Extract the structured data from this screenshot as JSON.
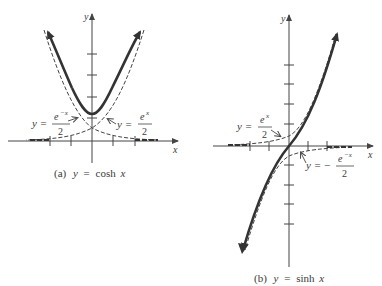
{
  "figure": {
    "panels": [
      {
        "id": "a",
        "caption_label": "(a)",
        "caption_eq_lhs": "y",
        "caption_eq_sign": "=",
        "caption_eq_rhs": "cosh",
        "caption_eq_var": "x",
        "x_axis_label": "x",
        "y_axis_label": "y",
        "annotations": [
          {
            "lhs": "y =",
            "numerator": "e",
            "exponent": "−x",
            "denominator": "2"
          },
          {
            "lhs": "y =",
            "numerator": "e",
            "exponent": "x",
            "denominator": "2"
          }
        ]
      },
      {
        "id": "b",
        "caption_label": "(b)",
        "caption_eq_lhs": "y",
        "caption_eq_sign": "=",
        "caption_eq_rhs": "sinh",
        "caption_eq_var": "x",
        "x_axis_label": "x",
        "y_axis_label": "y",
        "annotations": [
          {
            "lhs": "y =",
            "numerator": "e",
            "exponent": "x",
            "denominator": "2"
          },
          {
            "lhs": "y =  −",
            "numerator": "e",
            "exponent": "−x",
            "denominator": "2"
          }
        ]
      }
    ],
    "colors": {
      "curve": "#333333",
      "axis": "#444444",
      "dashed": "#444444"
    }
  }
}
